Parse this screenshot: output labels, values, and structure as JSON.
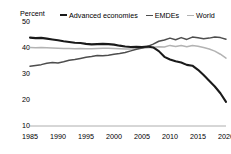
{
  "axis_unit_label": "Percent",
  "legend": {
    "items": [
      {
        "label": "Advanced economies",
        "color": "#1a1a1a",
        "width": 2.1
      },
      {
        "label": "EMDEs",
        "color": "#4d4d4d",
        "width": 1.5
      },
      {
        "label": "World",
        "color": "#b3b3b3",
        "width": 1.5
      }
    ]
  },
  "chart_data": {
    "type": "line",
    "title": "",
    "xlabel": "",
    "ylabel": "Percent",
    "xlim": [
      1985,
      2020
    ],
    "ylim": [
      10,
      50
    ],
    "yticks": [
      10,
      20,
      30,
      40,
      50
    ],
    "xticks": [
      1985,
      1990,
      1995,
      2000,
      2005,
      2010,
      2015,
      2020
    ],
    "grid": false,
    "legend_position": "top",
    "x": [
      1985,
      1986,
      1987,
      1988,
      1989,
      1990,
      1991,
      1992,
      1993,
      1994,
      1995,
      1996,
      1997,
      1998,
      1999,
      2000,
      2001,
      2002,
      2003,
      2004,
      2005,
      2006,
      2007,
      2008,
      2009,
      2010,
      2011,
      2012,
      2013,
      2014,
      2015,
      2016,
      2017,
      2018,
      2019,
      2020
    ],
    "series": [
      {
        "name": "Advanced economies",
        "color": "#1a1a1a",
        "width": 2.1,
        "values": [
          44.0,
          43.8,
          43.9,
          43.6,
          43.3,
          43.0,
          42.6,
          42.3,
          42.0,
          41.9,
          41.6,
          41.4,
          41.5,
          41.6,
          41.5,
          41.3,
          40.9,
          40.6,
          40.4,
          40.5,
          40.4,
          40.6,
          40.2,
          38.8,
          36.6,
          35.6,
          34.9,
          34.4,
          33.5,
          33.2,
          31.6,
          29.6,
          27.4,
          25.2,
          22.6,
          19.3
        ]
      },
      {
        "name": "EMDEs",
        "color": "#4d4d4d",
        "width": 1.5,
        "values": [
          33.0,
          33.3,
          33.6,
          34.1,
          34.4,
          34.2,
          34.7,
          35.3,
          35.6,
          36.0,
          36.4,
          36.7,
          37.1,
          37.0,
          37.2,
          37.6,
          37.9,
          38.3,
          38.9,
          39.5,
          40.0,
          40.6,
          41.5,
          42.6,
          43.1,
          43.8,
          43.2,
          44.0,
          43.3,
          44.2,
          43.9,
          43.6,
          43.8,
          44.2,
          44.0,
          43.4
        ]
      },
      {
        "name": "World",
        "color": "#b3b3b3",
        "width": 1.5,
        "values": [
          40.2,
          40.1,
          40.2,
          40.1,
          40.0,
          39.9,
          39.8,
          39.8,
          39.7,
          39.8,
          39.7,
          39.7,
          39.8,
          39.9,
          39.9,
          39.8,
          39.7,
          39.6,
          39.6,
          39.8,
          39.9,
          40.1,
          40.3,
          40.5,
          40.4,
          41.0,
          40.6,
          41.0,
          40.5,
          41.0,
          40.7,
          40.2,
          39.6,
          38.8,
          37.6,
          36.1
        ]
      }
    ]
  }
}
